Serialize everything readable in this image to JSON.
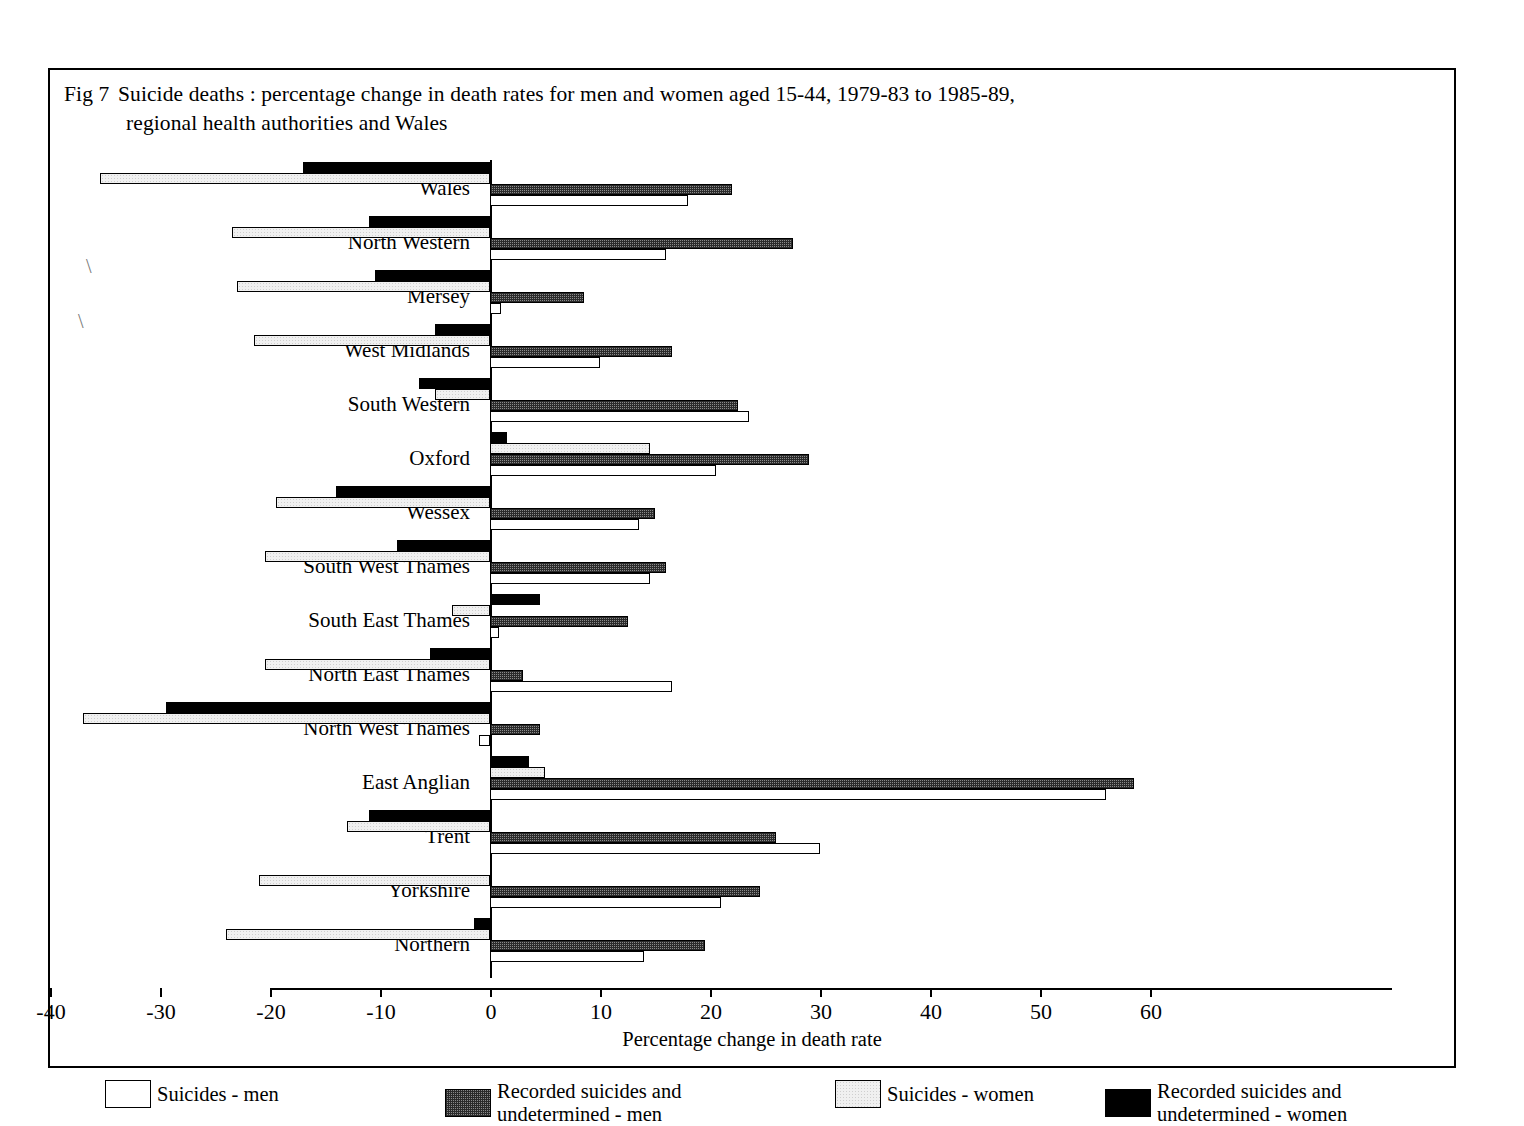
{
  "figure": {
    "number": "Fig 7",
    "title_line1": "Suicide deaths : percentage change in death rates for men and women aged 15-44, 1979-83 to 1985-89,",
    "title_line2": "regional health authorities and Wales"
  },
  "axis": {
    "x_title": "Percentage change in death rate",
    "x_ticks": [
      "-40",
      "-30",
      "-20",
      "-10",
      "0",
      "10",
      "20",
      "30",
      "40",
      "50",
      "60"
    ]
  },
  "legend": [
    {
      "label": "Suicides - men",
      "swatch": "white"
    },
    {
      "label": "Recorded suicides and\nundetermined - men",
      "swatch": "dotted"
    },
    {
      "label": "Suicides - women",
      "swatch": "light"
    },
    {
      "label": "Recorded suicides and\nundetermined - women",
      "swatch": "black"
    }
  ],
  "chart_data": {
    "type": "bar",
    "orientation": "horizontal",
    "xlabel": "Percentage change in death rate",
    "ylabel": "",
    "xlim": [
      -40,
      60
    ],
    "xtick_step": 10,
    "grid": false,
    "legend_position": "bottom",
    "categories": [
      "Wales",
      "North Western",
      "Mersey",
      "West Midlands",
      "South Western",
      "Oxford",
      "Wessex",
      "South West Thames",
      "South East Thames",
      "North East Thames",
      "North West Thames",
      "East Anglian",
      "Trent",
      "Yorkshire",
      "Northern"
    ],
    "series": [
      {
        "name": "Recorded suicides and undetermined - women",
        "fill": "black",
        "values": [
          -17.0,
          -11.0,
          -10.5,
          -5.0,
          -6.5,
          1.5,
          -14.0,
          -8.5,
          4.5,
          -5.5,
          -29.5,
          3.5,
          -11.0,
          0.0,
          -1.5
        ]
      },
      {
        "name": "Suicides - women",
        "fill": "light",
        "values": [
          -35.5,
          -23.5,
          -23.0,
          -21.5,
          -5.0,
          14.5,
          -19.5,
          -20.5,
          -3.5,
          -20.5,
          -37.0,
          5.0,
          -13.0,
          -21.0,
          -24.0
        ]
      },
      {
        "name": "Recorded suicides and undetermined - men",
        "fill": "dotted",
        "values": [
          22.0,
          27.5,
          8.5,
          16.5,
          22.5,
          29.0,
          15.0,
          16.0,
          12.5,
          3.0,
          4.5,
          58.5,
          26.0,
          24.5,
          19.5
        ]
      },
      {
        "name": "Suicides - men",
        "fill": "white",
        "values": [
          18.0,
          16.0,
          1.0,
          10.0,
          23.5,
          20.5,
          13.5,
          14.5,
          0.8,
          16.5,
          -1.0,
          56.0,
          30.0,
          21.0,
          14.0
        ]
      }
    ]
  }
}
